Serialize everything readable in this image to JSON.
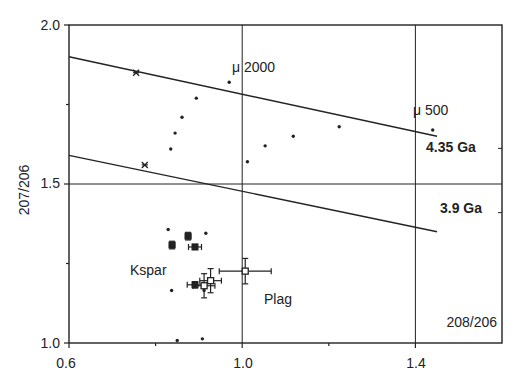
{
  "chart_data": {
    "type": "scatter",
    "title": "",
    "xlabel": "208/206",
    "ylabel": "207/206",
    "xlim": [
      0.6,
      1.6
    ],
    "ylim": [
      1.0,
      2.0
    ],
    "x_ticks": [
      0.6,
      1.0,
      1.4
    ],
    "x_tick_labels": [
      "0.6",
      "1.0",
      "1.4"
    ],
    "x_minor_ticks": [
      0.8,
      1.2
    ],
    "y_ticks": [
      1.0,
      1.5,
      2.0
    ],
    "y_tick_labels": [
      "1.0",
      "1.5",
      "2.0"
    ],
    "y_minor_ticks": [
      1.25,
      1.75
    ],
    "grid_lines": {
      "x": [
        1.0,
        1.4
      ],
      "y": [
        1.5
      ]
    },
    "lines": [
      {
        "name": "4.35 Ga",
        "label": "4.35 Ga",
        "x": [
          0.6,
          1.45
        ],
        "y": [
          1.9,
          1.65
        ]
      },
      {
        "name": "3.9 Ga",
        "label": "3.9 Ga",
        "x": [
          0.6,
          1.45
        ],
        "y": [
          1.59,
          1.35
        ]
      }
    ],
    "reference_markers": [
      {
        "symbol": "asterisk",
        "x": 0.755,
        "y": 1.85
      },
      {
        "symbol": "asterisk",
        "x": 0.775,
        "y": 1.56
      }
    ],
    "series": [
      {
        "name": "small points",
        "marker": "dot",
        "points": [
          {
            "x": 0.97,
            "y": 1.82
          },
          {
            "x": 0.894,
            "y": 1.77
          },
          {
            "x": 0.861,
            "y": 1.71
          },
          {
            "x": 0.845,
            "y": 1.66
          },
          {
            "x": 0.835,
            "y": 1.61
          },
          {
            "x": 1.012,
            "y": 1.57
          },
          {
            "x": 1.053,
            "y": 1.62
          },
          {
            "x": 1.118,
            "y": 1.65
          },
          {
            "x": 1.224,
            "y": 1.68
          },
          {
            "x": 1.44,
            "y": 1.67
          },
          {
            "x": 0.829,
            "y": 1.357
          },
          {
            "x": 0.916,
            "y": 1.345
          },
          {
            "x": 0.837,
            "y": 1.165
          },
          {
            "x": 0.912,
            "y": 1.165
          },
          {
            "x": 0.85,
            "y": 1.008
          },
          {
            "x": 0.908,
            "y": 1.013
          }
        ]
      },
      {
        "name": "Kspar",
        "marker": "filled-square",
        "points": [
          {
            "x": 0.838,
            "y": 1.308,
            "xerr": 0.006,
            "yerr": 0.012
          },
          {
            "x": 0.875,
            "y": 1.336,
            "xerr": 0.006,
            "yerr": 0.012
          },
          {
            "x": 0.891,
            "y": 1.302,
            "xerr": 0.015,
            "yerr": 0.008
          },
          {
            "x": 0.891,
            "y": 1.183,
            "xerr": 0.018,
            "yerr": 0.01
          }
        ]
      },
      {
        "name": "Plag",
        "marker": "open-square",
        "points": [
          {
            "x": 0.912,
            "y": 1.18,
            "xerr": 0.025,
            "yerr": 0.038
          },
          {
            "x": 0.927,
            "y": 1.196,
            "xerr": 0.025,
            "yerr": 0.038
          },
          {
            "x": 1.007,
            "y": 1.226,
            "xerr": 0.06,
            "yerr": 0.04
          }
        ]
      }
    ],
    "annotations": [
      {
        "text": "μ 2000",
        "x": 0.995,
        "y": 1.86
      },
      {
        "text": "μ 500",
        "x": 1.413,
        "y": 1.735
      },
      {
        "text": "4.35 Ga",
        "x": 1.45,
        "y": 1.612,
        "bold": true
      },
      {
        "text": "3.9 Ga",
        "x": 1.45,
        "y": 1.41,
        "bold": true
      },
      {
        "text": "Kspar",
        "x": 0.73,
        "y": 1.225
      },
      {
        "text": "Plag",
        "x": 1.06,
        "y": 1.145
      },
      {
        "text": "208/206",
        "x": 1.46,
        "y": 1.06
      }
    ],
    "legend": null
  },
  "labels": {
    "x_axis": "208/206",
    "y_axis": "207/206",
    "mu_2000": "μ 2000",
    "mu_500": "μ 500",
    "line_upper": "4.35 Ga",
    "line_lower": "3.9 Ga",
    "kspar": "Kspar",
    "plag": "Plag",
    "x_ticks": [
      "0.6",
      "1.0",
      "1.4"
    ],
    "y_ticks": [
      "1.0",
      "1.5",
      "2.0"
    ]
  }
}
